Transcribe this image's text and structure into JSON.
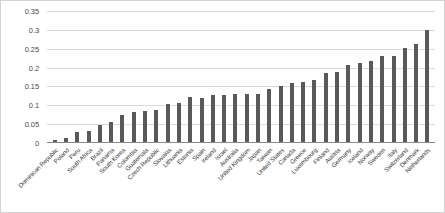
{
  "chart_data": {
    "type": "bar",
    "title": "",
    "subtitle": "",
    "xlabel": "",
    "ylabel": "",
    "ylim": [
      0,
      0.35
    ],
    "ytick_labels": [
      "0.35",
      "0.3",
      "0.25",
      "0.2",
      "0.15",
      "0.1",
      "0.05",
      "0"
    ],
    "ytick_values": [
      0.35,
      0.3,
      0.25,
      0.2,
      0.15,
      0.1,
      0.05,
      0
    ],
    "grid": true,
    "legend": null,
    "legend_position": "none",
    "bar_color": "#595959",
    "gridline_color": "#d9d9d9",
    "categories": [
      "Dominican Republic",
      "Poland",
      "Peru",
      "South Africa",
      "Brazil",
      "Panama",
      "South Korea",
      "Colombia",
      "Guatemala",
      "Czech Republic",
      "Slovakia",
      "Lithuania",
      "Estonia",
      "Spain",
      "Ireland",
      "Israel",
      "Australia",
      "United Kingdom",
      "Japan",
      "Taiwan",
      "United States",
      "Canada",
      "Greece",
      "Luxembourg",
      "Finland",
      "Austria",
      "Germany",
      "Iceland",
      "Norway",
      "Sweden",
      "Italy",
      "Switzerland",
      "Denmark",
      "Netherlands"
    ],
    "values": [
      0.007,
      0.012,
      0.03,
      0.032,
      0.049,
      0.057,
      0.075,
      0.081,
      0.085,
      0.087,
      0.104,
      0.107,
      0.121,
      0.12,
      0.126,
      0.127,
      0.129,
      0.129,
      0.131,
      0.142,
      0.152,
      0.16,
      0.163,
      0.168,
      0.185,
      0.189,
      0.206,
      0.212,
      0.218,
      0.23,
      0.231,
      0.252,
      0.262,
      0.3
    ]
  }
}
